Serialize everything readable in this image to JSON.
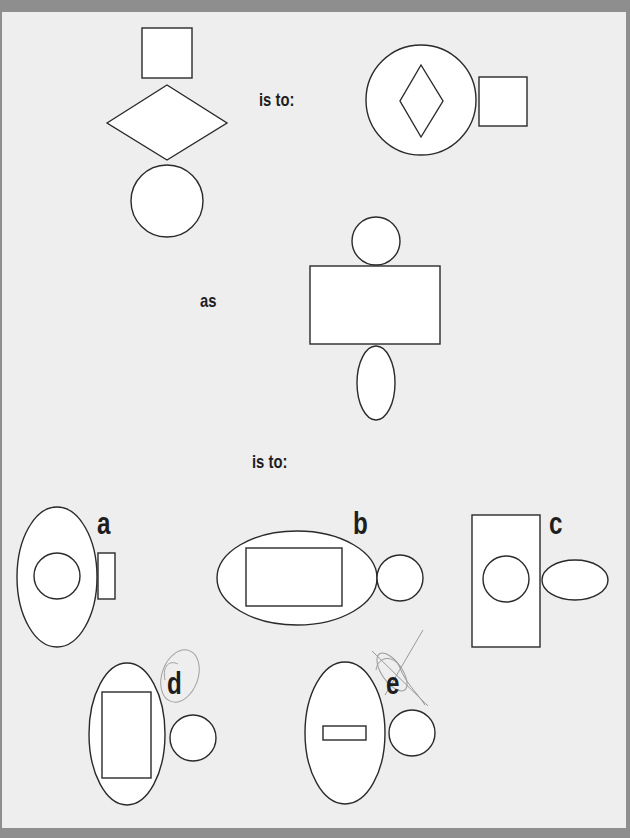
{
  "puzzle": {
    "text": {
      "is_to_1": "is to:",
      "as": "as",
      "is_to_2": "is to:"
    },
    "options": {
      "a": "a",
      "b": "b",
      "c": "c",
      "d": "d",
      "e": "e"
    },
    "colors": {
      "stroke": "#2a2a2a",
      "fill": "#ffffff",
      "page": "#eeeeee",
      "frame": "#8e8e8e",
      "pencil": "#9a9a9a"
    },
    "annotations": {
      "d": "pencil circle around option d",
      "e": "pencil scribble / cross-out over option e"
    }
  },
  "figures": {
    "first_term": [
      {
        "shape": "rect",
        "x": 142,
        "y": 28,
        "w": 50,
        "h": 50
      },
      {
        "shape": "polygon",
        "points": "107,123 167,85 227,123 167,160"
      },
      {
        "shape": "circle",
        "cx": 167,
        "cy": 201,
        "r": 36
      }
    ],
    "second_term": [
      {
        "shape": "circle",
        "cx": 421,
        "cy": 100,
        "r": 55
      },
      {
        "shape": "polygon",
        "points": "421,65 443,101 421,137 400,101"
      },
      {
        "shape": "rect",
        "x": 479,
        "y": 77,
        "w": 48,
        "h": 49
      }
    ],
    "third_term": [
      {
        "shape": "circle",
        "cx": 376,
        "cy": 241,
        "r": 24
      },
      {
        "shape": "rect",
        "x": 310,
        "y": 266,
        "w": 130,
        "h": 78
      },
      {
        "shape": "ellipse",
        "cx": 376,
        "cy": 383,
        "rx": 19,
        "ry": 37
      }
    ],
    "option_a": [
      {
        "shape": "ellipse",
        "cx": 57,
        "cy": 577,
        "rx": 40,
        "ry": 70
      },
      {
        "shape": "circle",
        "cx": 57,
        "cy": 576,
        "r": 23
      },
      {
        "shape": "rect",
        "x": 98,
        "y": 553,
        "w": 17,
        "h": 46
      }
    ],
    "option_b": [
      {
        "shape": "ellipse",
        "cx": 297,
        "cy": 578,
        "rx": 80,
        "ry": 47
      },
      {
        "shape": "rect",
        "x": 246,
        "y": 548,
        "w": 96,
        "h": 58
      },
      {
        "shape": "circle",
        "cx": 400,
        "cy": 578,
        "r": 23
      }
    ],
    "option_c": [
      {
        "shape": "rect",
        "x": 472,
        "y": 515,
        "w": 68,
        "h": 132
      },
      {
        "shape": "circle",
        "cx": 506,
        "cy": 579,
        "r": 23
      },
      {
        "shape": "ellipse",
        "cx": 575,
        "cy": 580,
        "rx": 33,
        "ry": 20
      }
    ],
    "option_d": [
      {
        "shape": "ellipse",
        "cx": 127,
        "cy": 734,
        "rx": 38,
        "ry": 71
      },
      {
        "shape": "rect",
        "x": 102,
        "y": 692,
        "w": 49,
        "h": 86
      },
      {
        "shape": "circle",
        "cx": 193,
        "cy": 738,
        "r": 23
      }
    ],
    "option_e": [
      {
        "shape": "ellipse",
        "cx": 345,
        "cy": 733,
        "rx": 40,
        "ry": 71
      },
      {
        "shape": "rect",
        "x": 323,
        "y": 726,
        "w": 43,
        "h": 14
      },
      {
        "shape": "circle",
        "cx": 412,
        "cy": 733,
        "r": 23
      }
    ]
  }
}
